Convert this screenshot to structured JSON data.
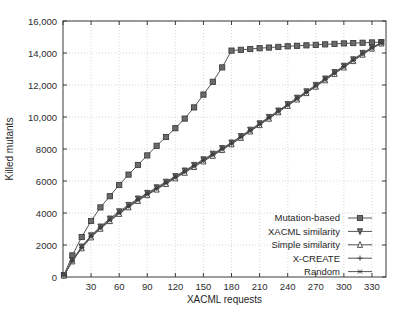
{
  "chart_data": {
    "type": "line",
    "title": "",
    "xlabel": "XACML requests",
    "ylabel": "Killed mutants",
    "xlim": [
      0,
      345
    ],
    "ylim": [
      0,
      16000
    ],
    "grid": true,
    "legend_position": "bottom-right",
    "xticks": [
      0,
      30,
      60,
      90,
      120,
      150,
      180,
      210,
      240,
      270,
      300,
      330
    ],
    "xtick_labels": [
      "0",
      "30",
      "60",
      "90",
      "120",
      "150",
      "180",
      "210",
      "240",
      "270",
      "300",
      "330"
    ],
    "yticks": [
      0,
      2000,
      4000,
      6000,
      8000,
      10000,
      12000,
      14000,
      16000
    ],
    "ytick_labels": [
      "0",
      "2000",
      "4000",
      "6000",
      "8000",
      "10,000",
      "12,000",
      "14,000",
      "16,000"
    ],
    "x": [
      1,
      10,
      20,
      30,
      40,
      50,
      60,
      70,
      80,
      90,
      100,
      110,
      120,
      130,
      140,
      150,
      160,
      170,
      180,
      190,
      200,
      210,
      220,
      230,
      240,
      250,
      260,
      270,
      280,
      290,
      300,
      310,
      320,
      330,
      340
    ],
    "series": [
      {
        "name": "Mutation-based",
        "marker": "filled-square",
        "values": [
          120,
          1350,
          2500,
          3500,
          4350,
          5050,
          5750,
          6400,
          7000,
          7600,
          8200,
          8750,
          9300,
          9900,
          10600,
          11400,
          12200,
          13100,
          14150,
          14200,
          14250,
          14300,
          14340,
          14380,
          14420,
          14450,
          14480,
          14510,
          14540,
          14570,
          14600,
          14620,
          14640,
          14660,
          14680
        ]
      },
      {
        "name": "XACML similarity",
        "marker": "filled-triangle-down",
        "values": [
          100,
          1050,
          1900,
          2600,
          3150,
          3650,
          4100,
          4500,
          4900,
          5250,
          5600,
          5950,
          6300,
          6650,
          7000,
          7350,
          7700,
          8050,
          8400,
          8800,
          9200,
          9600,
          10000,
          10400,
          10800,
          11200,
          11600,
          12000,
          12400,
          12800,
          13200,
          13600,
          14000,
          14350,
          14650
        ]
      },
      {
        "name": "Simple similarity",
        "marker": "open-triangle-up",
        "values": [
          95,
          980,
          1800,
          2480,
          3020,
          3500,
          3950,
          4360,
          4760,
          5120,
          5470,
          5820,
          6170,
          6520,
          6880,
          7230,
          7580,
          7940,
          8300,
          8700,
          9100,
          9500,
          9900,
          10300,
          10700,
          11100,
          11500,
          11900,
          12300,
          12700,
          13100,
          13500,
          13900,
          14280,
          14600
        ]
      },
      {
        "name": "X-CREATE",
        "marker": "plus",
        "values": [
          105,
          1020,
          1860,
          2550,
          3100,
          3580,
          4030,
          4440,
          4840,
          5200,
          5550,
          5900,
          6250,
          6600,
          6950,
          7300,
          7650,
          8000,
          8360,
          8760,
          9160,
          9560,
          9960,
          10360,
          10760,
          11160,
          11560,
          11960,
          12360,
          12760,
          13160,
          13560,
          13960,
          14320,
          14620
        ]
      },
      {
        "name": "Random",
        "marker": "star",
        "values": [
          90,
          1000,
          1830,
          2520,
          3060,
          3540,
          3990,
          4400,
          4800,
          5160,
          5510,
          5860,
          6210,
          6560,
          6910,
          7260,
          7620,
          7980,
          8330,
          8730,
          9130,
          9530,
          9930,
          10330,
          10730,
          11130,
          11530,
          11930,
          12330,
          12730,
          13130,
          13530,
          13930,
          14300,
          14610
        ]
      }
    ]
  }
}
